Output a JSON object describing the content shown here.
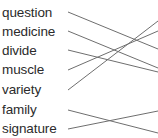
{
  "canvas": {
    "width": 158,
    "height": 138,
    "background": "#ffffff",
    "text_color": "#2b2b2b",
    "line_color": "#6e6e6e"
  },
  "left_column": {
    "items": [
      {
        "label": "question",
        "y": 12
      },
      {
        "label": "medicine",
        "y": 31
      },
      {
        "label": "divide",
        "y": 50
      },
      {
        "label": "muscle",
        "y": 70
      },
      {
        "label": "variety",
        "y": 90
      },
      {
        "label": "family",
        "y": 110
      },
      {
        "label": "signature",
        "y": 129
      }
    ]
  },
  "connectors": {
    "origin_x": 68,
    "edge_x": 158,
    "lines": [
      {
        "from_label": "question",
        "x1": 68,
        "y1": 12,
        "x2": 158,
        "y2": 49
      },
      {
        "from_label": "medicine",
        "x1": 68,
        "y1": 31,
        "x2": 158,
        "y2": 68
      },
      {
        "from_label": "divide",
        "x1": 68,
        "y1": 50,
        "x2": 158,
        "y2": 72
      },
      {
        "from_label": "muscle",
        "x1": 68,
        "y1": 70,
        "x2": 158,
        "y2": 31
      },
      {
        "from_label": "variety",
        "x1": 68,
        "y1": 90,
        "x2": 158,
        "y2": 21
      },
      {
        "from_label": "family",
        "x1": 68,
        "y1": 110,
        "x2": 158,
        "y2": 133
      },
      {
        "from_label": "signature",
        "x1": 68,
        "y1": 129,
        "x2": 158,
        "y2": 111
      }
    ]
  }
}
